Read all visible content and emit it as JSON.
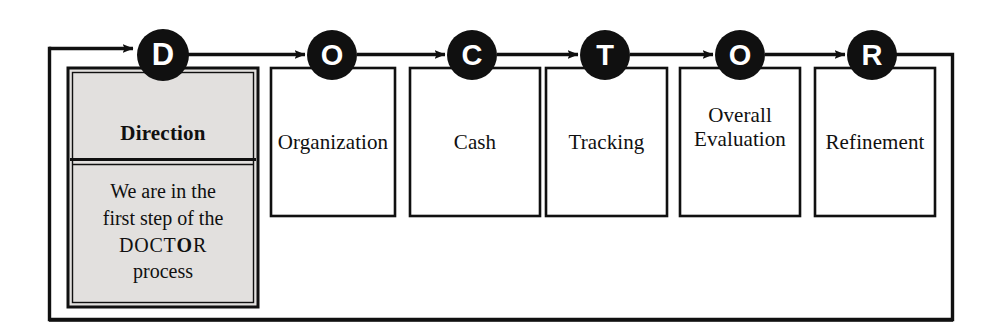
{
  "diagram": {
    "acronym": "DOCTOR",
    "colors": {
      "line": "#101010",
      "highlight_fill": "#e2e0de",
      "box_fill": "#ffffff",
      "circle_fill": "#101010",
      "circle_text": "#ffffff",
      "text": "#101010"
    },
    "steps": [
      {
        "letter": "D",
        "label": "Direction",
        "highlighted": true,
        "detail_lines": [
          "We are in the",
          "first step of the",
          "DOCTOR",
          "process"
        ],
        "detail_text": "We are in the first step of the DOCTOR process",
        "detail_emphasis_letter": "O"
      },
      {
        "letter": "O",
        "label": "Organization",
        "highlighted": false
      },
      {
        "letter": "C",
        "label": "Cash",
        "highlighted": false
      },
      {
        "letter": "T",
        "label": "Tracking",
        "highlighted": false
      },
      {
        "letter": "O",
        "label": "Overall Evaluation",
        "label_lines": [
          "Overall",
          "Evaluation"
        ],
        "highlighted": false
      },
      {
        "letter": "R",
        "label": "Refinement",
        "highlighted": false
      }
    ],
    "feedback_loop": {
      "name": "feedback-loop",
      "from_step_letter": "R",
      "to_step_letter": "D",
      "direction": "right-to-left"
    }
  }
}
